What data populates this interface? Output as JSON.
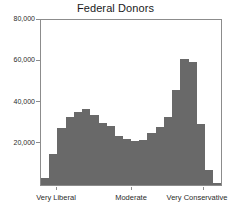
{
  "chart_data": {
    "type": "bar",
    "title": "Federal Donors",
    "subtitle": "",
    "xlabel": "",
    "ylabel": "",
    "ylim": [
      0,
      80000
    ],
    "grid": false,
    "legend": null,
    "y_ticks": [
      {
        "value": 80000,
        "label": "80,000"
      },
      {
        "value": 60000,
        "label": "60,000"
      },
      {
        "value": 40000,
        "label": "40,000"
      },
      {
        "value": 20000,
        "label": "20,000"
      }
    ],
    "x_ticks": [
      {
        "position": 0.085,
        "label": "Very Liberal"
      },
      {
        "position": 0.5,
        "label": "Moderate"
      },
      {
        "position": 0.9,
        "label": "Very Conservative"
      }
    ],
    "categories": [
      "b1",
      "b2",
      "b3",
      "b4",
      "b5",
      "b6",
      "b7",
      "b8",
      "b9",
      "b10",
      "b11",
      "b12",
      "b13",
      "b14",
      "b15",
      "b16",
      "b17",
      "b18",
      "b19",
      "b20"
    ],
    "values": [
      3500,
      15000,
      27500,
      33000,
      35500,
      37000,
      34000,
      30000,
      28500,
      24000,
      22500,
      21500,
      22000,
      25000,
      28000,
      33000,
      46000,
      61000,
      59500,
      29500
    ],
    "bar_color": "#696969",
    "frame_color": "#8c8c8c",
    "background_color": "#ffffff",
    "n_bars": 20
  },
  "tail_bars": {
    "values": [
      7500,
      1200
    ],
    "note": ""
  },
  "axes": {
    "y_axis_name": "donor-count-axis",
    "x_axis_name": "ideology-axis"
  }
}
